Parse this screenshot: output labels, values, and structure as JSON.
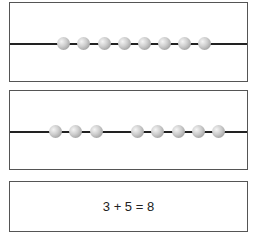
{
  "panels": [
    {
      "name": "all-beads",
      "bead_count": 8,
      "groups": [
        8
      ]
    },
    {
      "name": "split-beads",
      "bead_count": 8,
      "groups": [
        3,
        5
      ]
    }
  ],
  "equation": {
    "text": "3 + 5 = 8",
    "addend1": 3,
    "addend2": 5,
    "sum": 8
  },
  "colors": {
    "border": "#555555",
    "wire": "#222222",
    "bead": "#b0b0b0"
  }
}
